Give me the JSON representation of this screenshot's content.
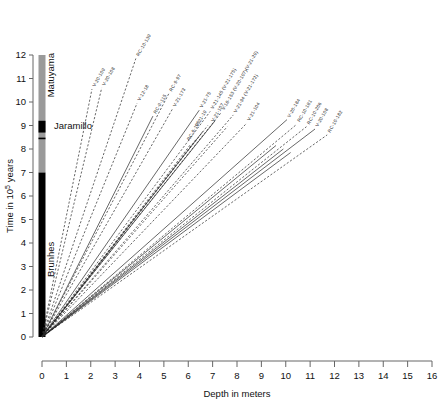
{
  "figure": {
    "title": "",
    "xlabel": "Depth in meters",
    "ylabel_main": "Time in 10",
    "ylabel_sup": "5",
    "ylabel_tail": " years"
  },
  "chronology": {
    "label_matuyama": "Matuyama",
    "label_jaramillo": "Jaramillo",
    "label_brunhes": "Brunhes",
    "brunhes_range": [
      0,
      7
    ],
    "jaramillo_range": [
      8.7,
      9.2
    ],
    "jaramillo_tick": 8.45,
    "matuyama_range": [
      7,
      12
    ],
    "color_normal": "#000000",
    "color_reversed": "#9a9a9a"
  },
  "chart_data": {
    "type": "line",
    "title": "",
    "xlabel": "Depth in meters",
    "ylabel": "Time in 10^5 years",
    "xlim": [
      0,
      16
    ],
    "ylim": [
      0,
      12
    ],
    "xticks": [
      "0",
      "1",
      "2",
      "3",
      "4",
      "5",
      "6",
      "7",
      "8",
      "9",
      "10",
      "11",
      "12",
      "13",
      "14",
      "15",
      "16"
    ],
    "yticks": [
      "0",
      "1",
      "2",
      "3",
      "4",
      "5",
      "6",
      "7",
      "8",
      "9",
      "10",
      "11",
      "12"
    ],
    "grid": false,
    "legend": "inline-end-labels",
    "note": "All sediment-accumulation lines radiate from the origin (0,0); each line's slope is the core's accumulation rate. End point (x_end, y_end) is where the line stops and its label begins.",
    "series": [
      {
        "name": "V-20-109",
        "x_end": 2.05,
        "y_end": 10.55,
        "style": "dashed"
      },
      {
        "name": "V-20-108",
        "x_end": 2.45,
        "y_end": 10.6,
        "style": "dashed"
      },
      {
        "name": "RC-10-139",
        "x_end": 3.85,
        "y_end": 11.85,
        "style": "dashed"
      },
      {
        "name": "V-12-18",
        "x_end": 3.9,
        "y_end": 9.95,
        "style": "dashed"
      },
      {
        "name": "RC-9-115",
        "x_end": 4.55,
        "y_end": 9.4,
        "style": "solid"
      },
      {
        "name": "RC-9-97",
        "x_end": 5.2,
        "y_end": 10.35,
        "style": "dashed"
      },
      {
        "name": "V-21-173",
        "x_end": 5.35,
        "y_end": 9.7,
        "style": "dashed"
      },
      {
        "name": "V-21-75",
        "x_end": 6.45,
        "y_end": 9.65,
        "style": "solid"
      },
      {
        "name": "V-21-145  (V-21-175)",
        "x_end": 6.9,
        "y_end": 9.6,
        "style": "dashed"
      },
      {
        "name": "V-18-153  (V-20-107)(V-21-29)",
        "x_end": 7.35,
        "y_end": 9.55,
        "style": "dashed"
      },
      {
        "name": "V-21-94  (V-21-172)",
        "x_end": 7.85,
        "y_end": 9.45,
        "style": "dashed"
      },
      {
        "name": "V-21-104",
        "x_end": 8.4,
        "y_end": 9.1,
        "style": "dashed"
      },
      {
        "name": "V-20-184",
        "x_end": 10.05,
        "y_end": 9.25,
        "style": "solid"
      },
      {
        "name": "RC-10-181",
        "x_end": 10.45,
        "y_end": 9.05,
        "style": "dashed"
      },
      {
        "name": "RC-10-206",
        "x_end": 10.85,
        "y_end": 8.95,
        "style": "dashed"
      },
      {
        "name": "V-20-108b",
        "x_end": 11.2,
        "y_end": 8.85,
        "style": "solid"
      },
      {
        "name": "RC-10-182",
        "x_end": 11.7,
        "y_end": 8.6,
        "style": "dashed"
      },
      {
        "name": "",
        "x_end": 6.1,
        "y_end": 8.2,
        "style": "dashed"
      },
      {
        "name": "",
        "x_end": 6.35,
        "y_end": 8.45,
        "style": "dashed"
      },
      {
        "name": "",
        "x_end": 6.6,
        "y_end": 8.75,
        "style": "solid"
      },
      {
        "name": "",
        "x_end": 6.8,
        "y_end": 9.0,
        "style": "dashed"
      },
      {
        "name": "",
        "x_end": 7.1,
        "y_end": 9.2,
        "style": "solid"
      },
      {
        "name": "",
        "x_end": 7.6,
        "y_end": 8.95,
        "style": "dashed"
      },
      {
        "name": "",
        "x_end": 9.6,
        "y_end": 8.15,
        "style": "solid"
      },
      {
        "name": "",
        "x_end": 9.9,
        "y_end": 8.0,
        "style": "solid"
      },
      {
        "name": "",
        "x_end": 10.2,
        "y_end": 7.85,
        "style": "solid"
      }
    ],
    "inner_labels": [
      {
        "text": "V-21-19",
        "x": 6.4,
        "y": 8.95
      },
      {
        "text": "RC-9-105",
        "x": 6.05,
        "y": 8.35
      },
      {
        "text": "V-21-107",
        "x": 7.05,
        "y": 9.15
      }
    ]
  }
}
